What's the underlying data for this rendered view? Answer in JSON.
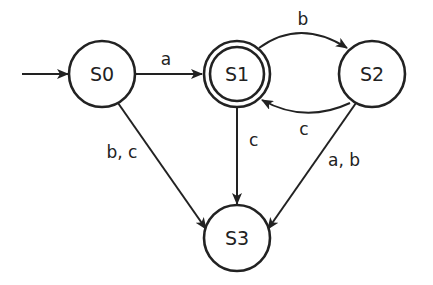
{
  "diagram": {
    "type": "finite-state-automaton",
    "initial_state": "S0",
    "accepting_states": [
      "S1"
    ],
    "states": [
      {
        "id": "S0",
        "label": "S0",
        "cx": 102,
        "cy": 74,
        "accepting": false
      },
      {
        "id": "S1",
        "label": "S1",
        "cx": 237,
        "cy": 74,
        "accepting": true
      },
      {
        "id": "S2",
        "label": "S2",
        "cx": 372,
        "cy": 74,
        "accepting": false
      },
      {
        "id": "S3",
        "label": "S3",
        "cx": 237,
        "cy": 238,
        "accepting": false
      }
    ],
    "transitions": [
      {
        "from": "S0",
        "to": "S1",
        "label": "a"
      },
      {
        "from": "S0",
        "to": "S3",
        "label": "b, c"
      },
      {
        "from": "S1",
        "to": "S2",
        "label": "b"
      },
      {
        "from": "S1",
        "to": "S3",
        "label": "c"
      },
      {
        "from": "S2",
        "to": "S1",
        "label": "c"
      },
      {
        "from": "S2",
        "to": "S3",
        "label": "a, b"
      }
    ],
    "colors": {
      "stroke": "#222222",
      "background": "#ffffff",
      "text": "#222222"
    }
  }
}
